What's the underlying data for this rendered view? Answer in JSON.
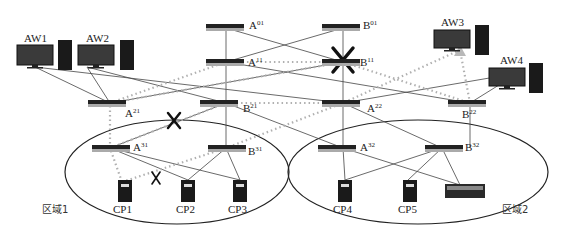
{
  "diagram": {
    "type": "network-topology",
    "workstations": [
      {
        "id": "AW1",
        "label": "AW1"
      },
      {
        "id": "AW2",
        "label": "AW2"
      },
      {
        "id": "AW3",
        "label": "AW3"
      },
      {
        "id": "AW4",
        "label": "AW4"
      }
    ],
    "switches": [
      {
        "id": "A01",
        "base": "A",
        "sup": "01"
      },
      {
        "id": "B01",
        "base": "B",
        "sup": "01"
      },
      {
        "id": "A11",
        "base": "A",
        "sup": "11"
      },
      {
        "id": "B11",
        "base": "B",
        "sup": "11"
      },
      {
        "id": "A21",
        "base": "A",
        "sup": "21"
      },
      {
        "id": "B21",
        "base": "B",
        "sup": "21"
      },
      {
        "id": "A22",
        "base": "A",
        "sup": "22"
      },
      {
        "id": "B22",
        "base": "B",
        "sup": "22"
      },
      {
        "id": "A31",
        "base": "A",
        "sup": "31"
      },
      {
        "id": "B31",
        "base": "B",
        "sup": "31"
      },
      {
        "id": "A32",
        "base": "A",
        "sup": "32"
      },
      {
        "id": "B32",
        "base": "B",
        "sup": "32"
      }
    ],
    "controllers": [
      {
        "id": "CP1",
        "label": "CP1"
      },
      {
        "id": "CP2",
        "label": "CP2"
      },
      {
        "id": "CP3",
        "label": "CP3"
      },
      {
        "id": "CP4",
        "label": "CP4"
      },
      {
        "id": "CP5",
        "label": "CP5"
      }
    ],
    "zones": [
      {
        "id": "zone1",
        "label": "区域1"
      },
      {
        "id": "zone2",
        "label": "区域2"
      }
    ],
    "failures": [
      "B11 switch",
      "A21-B21 link",
      "A31-CP1 link"
    ],
    "colors": {
      "line": "#333333",
      "path": "#b0b0b0",
      "device": "#1a1a1a",
      "failure": "#111111"
    }
  }
}
